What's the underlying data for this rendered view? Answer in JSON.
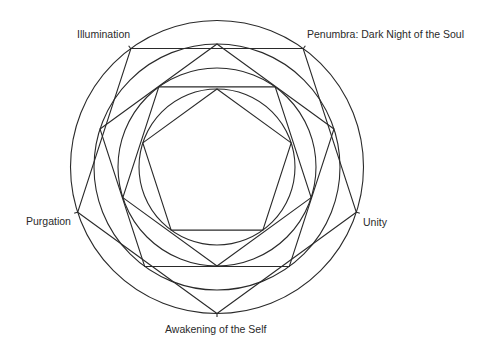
{
  "diagram": {
    "center": {
      "x": 217,
      "y": 167
    },
    "stroke_color": "#2a2a2a",
    "background": "#ffffff",
    "rings": [
      {
        "name": "outer-circle",
        "r": 146.5
      },
      {
        "name": "second-circle",
        "r": 123
      },
      {
        "name": "third-circle",
        "r": 99
      },
      {
        "name": "inner-circle",
        "r": 78
      }
    ],
    "pentagons": [
      {
        "name": "outer-pentagon-point-down",
        "r": 146.5,
        "orientation": "down"
      },
      {
        "name": "second-pentagon-point-up",
        "r": 123,
        "orientation": "up"
      },
      {
        "name": "third-pentagon-point-down",
        "r": 99,
        "orientation": "down"
      },
      {
        "name": "inner-pentagon-point-up",
        "r": 78,
        "orientation": "up"
      }
    ],
    "labels": [
      {
        "id": "illumination",
        "text": "Illumination",
        "x": 77,
        "y": 29,
        "vertex": [
          131,
          49
        ]
      },
      {
        "id": "penumbra",
        "text": "Penumbra: Dark Night of the Soul",
        "x": 307,
        "y": 29,
        "vertex": [
          303,
          49
        ]
      },
      {
        "id": "unity",
        "text": "Unity",
        "x": 363,
        "y": 217,
        "vertex": [
          356,
          212
        ]
      },
      {
        "id": "awakening",
        "text": "Awakening of the Self",
        "x": 165,
        "y": 324,
        "vertex": [
          217,
          313
        ]
      },
      {
        "id": "purgation",
        "text": "Purgation",
        "x": 26,
        "y": 216,
        "vertex": [
          78,
          212
        ]
      }
    ]
  }
}
